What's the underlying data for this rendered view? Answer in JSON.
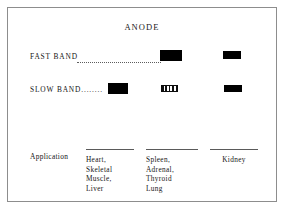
{
  "figure": {
    "title": "ANODE",
    "frame_color": "#8d8d8d",
    "band_color": "#000000"
  },
  "rows": [
    {
      "label": "FAST BAND",
      "leader": "dotted",
      "bands": [
        {
          "column": 1,
          "present": false,
          "style": "none"
        },
        {
          "column": 2,
          "present": true,
          "style": "solid"
        },
        {
          "column": 3,
          "present": true,
          "style": "solid"
        }
      ]
    },
    {
      "label": "SLOW BAND........",
      "leader": "none",
      "bands": [
        {
          "column": 1,
          "present": true,
          "style": "solid"
        },
        {
          "column": 2,
          "present": true,
          "style": "hatched"
        },
        {
          "column": 3,
          "present": true,
          "style": "solid"
        }
      ]
    }
  ],
  "application": {
    "label": "Application",
    "columns": [
      {
        "text": "Heart,\nSkeletal\nMuscle,\nLiver",
        "align": "left"
      },
      {
        "text": "Spleen,\nAdrenal,\nThyroid\nLung",
        "align": "left"
      },
      {
        "text": "Kidney",
        "align": "center"
      }
    ]
  }
}
